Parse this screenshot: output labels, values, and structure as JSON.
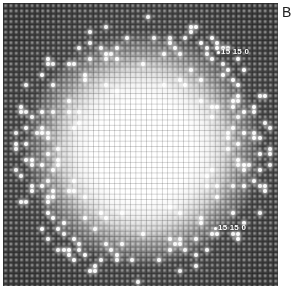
{
  "figure": {
    "panel_label": "B",
    "image_description": "electron diffraction pattern with square lattice of spots and bright central glow",
    "annotations": [
      {
        "text": "15 15 0",
        "position": "upper-right"
      },
      {
        "text": "15 15 0",
        "position": "lower-right"
      }
    ],
    "colors": {
      "background": "#3e3e3e",
      "center_glow": "#ffffff",
      "spots": "#ffffff",
      "page": "#ffffff"
    }
  }
}
